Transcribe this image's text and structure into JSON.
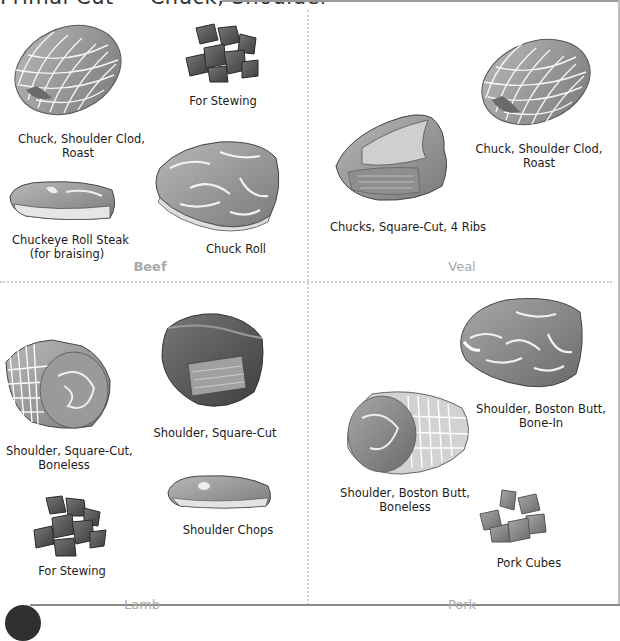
{
  "header": {
    "title": "Primal Cut — Chuck, Shoulder"
  },
  "sections": {
    "beef": {
      "name": "Beef",
      "items": [
        {
          "label_line1": "Chuck, Shoulder Clod,",
          "label_line2": "Roast",
          "icon": "tied-roast-illustration"
        },
        {
          "label_line1": "For Stewing",
          "icon": "stew-cubes-illustration"
        },
        {
          "label_line1": "Chuckeye Roll Steak",
          "label_line2": "(for braising)",
          "icon": "steak-illustration"
        },
        {
          "label_line1": "Chuck Roll",
          "icon": "chuck-roll-illustration"
        }
      ]
    },
    "veal": {
      "name": "Veal",
      "items": [
        {
          "label_line1": "Chucks, Square-Cut, 4 Ribs",
          "icon": "square-cut-illustration"
        },
        {
          "label_line1": "Chuck, Shoulder Clod,",
          "label_line2": "Roast",
          "icon": "tied-roast-illustration"
        }
      ]
    },
    "lamb": {
      "name": "Lamb",
      "items": [
        {
          "label_line1": "Shoulder, Square-Cut,",
          "label_line2": "Boneless",
          "icon": "boneless-roast-illustration"
        },
        {
          "label_line1": "Shoulder, Square-Cut",
          "icon": "square-cut-illustration"
        },
        {
          "label_line1": "For Stewing",
          "icon": "stew-cubes-illustration"
        },
        {
          "label_line1": "Shoulder Chops",
          "icon": "chop-illustration"
        }
      ]
    },
    "pork": {
      "name": "Pork",
      "items": [
        {
          "label_line1": "Shoulder, Boston Butt,",
          "label_line2": "Bone-In",
          "icon": "bone-in-roast-illustration"
        },
        {
          "label_line1": "Shoulder, Boston Butt,",
          "label_line2": "Boneless",
          "icon": "boneless-roast-illustration"
        },
        {
          "label_line1": "Pork Cubes",
          "icon": "pork-cubes-illustration"
        }
      ]
    }
  },
  "colors": {
    "meat_dark": "#6e6e6e",
    "meat_mid": "#9a9a9a",
    "meat_light": "#c4c4c4",
    "section_label": "#a8a8a8"
  }
}
